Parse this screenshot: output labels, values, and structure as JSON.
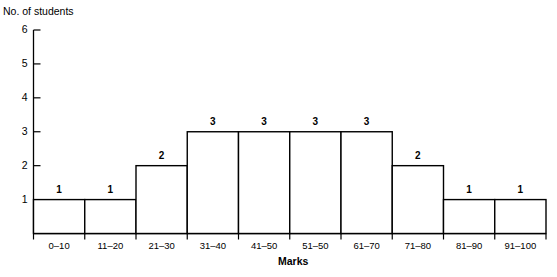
{
  "chart_data": {
    "type": "bar",
    "title": "",
    "subtitle": "",
    "xlabel": "Marks",
    "ylabel": "No. of students",
    "categories": [
      "0–10",
      "11–20",
      "21–30",
      "31–40",
      "41–50",
      "51–50",
      "61–70",
      "71–80",
      "81–90",
      "91–100"
    ],
    "values": [
      1,
      1,
      2,
      3,
      3,
      3,
      3,
      2,
      1,
      1
    ],
    "value_labels": [
      "1",
      "1",
      "2",
      "3",
      "3",
      "3",
      "3",
      "2",
      "1",
      "1"
    ],
    "ylim": [
      0,
      6
    ],
    "ytick_labels": [
      "1",
      "2",
      "3",
      "4",
      "5",
      "6"
    ],
    "ytick_values": [
      1,
      2,
      3,
      4,
      5,
      6
    ],
    "grid": false,
    "legend": null,
    "bar_fill_color": "#ffffff",
    "bar_stroke_color": "#000000",
    "axis_color": "#000000",
    "text_color": "#000000"
  }
}
